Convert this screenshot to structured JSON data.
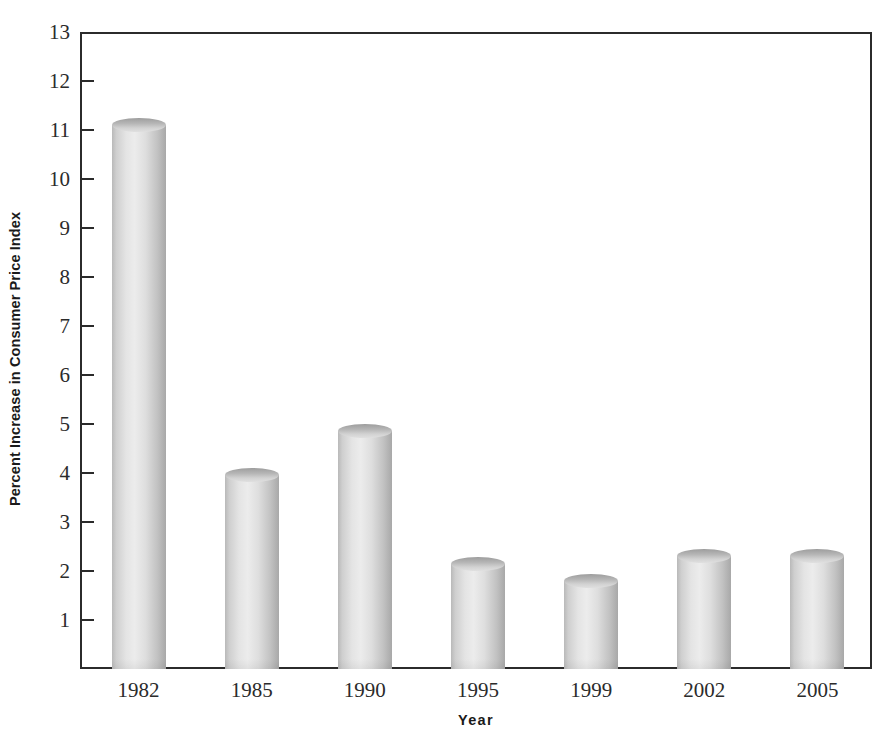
{
  "chart_data": {
    "type": "bar",
    "title": "",
    "xlabel": "Year",
    "ylabel": "Percent Increase in Consumer Price Index",
    "categories": [
      "1982",
      "1985",
      "1990",
      "1995",
      "1999",
      "2002",
      "2005"
    ],
    "values": [
      11.1,
      3.95,
      4.85,
      2.15,
      1.8,
      2.3,
      2.3
    ],
    "ylim": [
      0,
      13
    ],
    "yticks": [
      13,
      12,
      11,
      10,
      9,
      8,
      7,
      6,
      5,
      4,
      3,
      2,
      1
    ],
    "ytick_labels": [
      "13",
      "12",
      "11",
      "10",
      "9",
      "8",
      "7",
      "6",
      "5",
      "4",
      "3",
      "2",
      "1"
    ],
    "grid": false,
    "legend": null,
    "bar_style": "3d-cylinder",
    "bar_color": "#d8d8d8"
  }
}
